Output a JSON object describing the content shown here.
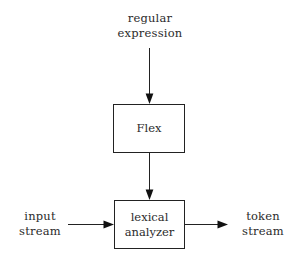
{
  "diagram": {
    "background_color": "#ffffff",
    "line_color": "#222222",
    "text_color": "#2b2b2b",
    "labels": {
      "regular_expression_line1": "regular",
      "regular_expression_line2": "expression",
      "input_stream_line1": "input",
      "input_stream_line2": "stream",
      "token_stream_line1": "token",
      "token_stream_line2": "stream"
    },
    "nodes": {
      "flex": {
        "label": "Flex"
      },
      "lexical_analyzer": {
        "label_line1": "lexical",
        "label_line2": "analyzer"
      }
    },
    "edges": [
      {
        "name": "regular-expression-to-flex",
        "direction": "down",
        "from": "regular expression",
        "to": "Flex"
      },
      {
        "name": "flex-to-lexical-analyzer",
        "direction": "down",
        "from": "Flex",
        "to": "lexical analyzer"
      },
      {
        "name": "input-stream-to-lexical-analyzer",
        "direction": "right",
        "from": "input stream",
        "to": "lexical analyzer"
      },
      {
        "name": "lexical-analyzer-to-token-stream",
        "direction": "right",
        "from": "lexical analyzer",
        "to": "token stream"
      }
    ]
  }
}
